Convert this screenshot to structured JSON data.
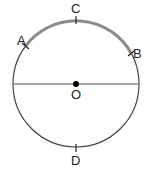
{
  "diagram": {
    "type": "circle-geometry",
    "labels": {
      "A": "A",
      "B": "B",
      "C": "C",
      "D": "D",
      "O": "O"
    },
    "colors": {
      "circle": "#444444",
      "arc_highlight": "#8a8a8a",
      "diameter": "#8a8a8a",
      "center": "#000000"
    }
  }
}
